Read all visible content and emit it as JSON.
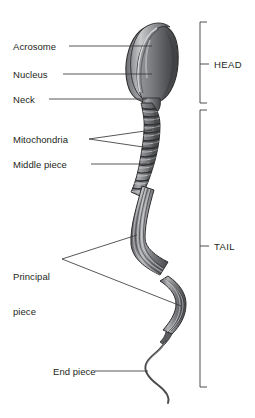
{
  "figure": {
    "background_color": "#ffffff",
    "text_color": "#231f20",
    "leader_color": "#3a3a3a"
  },
  "labels": {
    "acrosome": "Acrosome",
    "nucleus": "Nucleus",
    "neck": "Neck",
    "mitochondria": "Mitochondria",
    "middle_piece": "Middle piece",
    "principal_piece_line1": "Principal",
    "principal_piece_line2": "piece",
    "end_piece": "End piece"
  },
  "regions": {
    "head": "HEAD",
    "tail": "TAIL"
  },
  "colors": {
    "cell_dark": "#4a4a4c",
    "cell_mid": "#77787b",
    "cell_light": "#b9babc",
    "cell_highlight": "#e2e3e4",
    "outline": "#2f2f31"
  }
}
